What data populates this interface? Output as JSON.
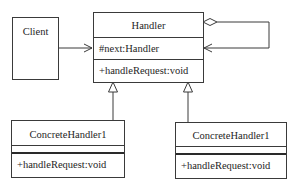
{
  "diagram": {
    "type": "UML class diagram",
    "pattern": "Chain of Responsibility",
    "colors": {
      "line": "#3a3a3a",
      "text": "#1e1e1e",
      "background": "#ffffff"
    },
    "classes": {
      "client": {
        "name": "Client"
      },
      "handler": {
        "name": "Handler",
        "attributes": [
          "#next:Handler"
        ],
        "operations": [
          "+handleRequest:void"
        ]
      },
      "concrete_left": {
        "name": "ConcreteHandler1",
        "attributes": [],
        "operations": [
          "+handleRequest:void"
        ]
      },
      "concrete_right": {
        "name": "ConcreteHandler1",
        "attributes": [],
        "operations": [
          "+handleRequest:void"
        ]
      }
    },
    "relationships": [
      {
        "from": "Client",
        "to": "Handler",
        "type": "association",
        "arrow": "open"
      },
      {
        "from": "Handler",
        "to": "Handler",
        "type": "aggregation",
        "arrow": "open",
        "label": "next"
      },
      {
        "from": "ConcreteHandler1 (left)",
        "to": "Handler",
        "type": "generalization"
      },
      {
        "from": "ConcreteHandler1 (right)",
        "to": "Handler",
        "type": "generalization"
      }
    ]
  }
}
